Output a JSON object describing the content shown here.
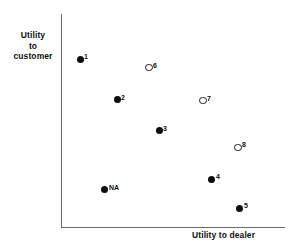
{
  "chart_data": {
    "type": "scatter",
    "title": "",
    "xlabel": "Utility to dealer",
    "ylabel": "Utility\nto\ncustomer",
    "grid": false,
    "legend": null,
    "axis_style": "open-corner-axes-no-ticks",
    "xlim": [
      0,
      100
    ],
    "ylim": [
      0,
      100
    ],
    "note": "Axes are unlabeled qualitative scales; values below are read off relative pixel positions.",
    "marker_styles": {
      "filled": "solid black circle",
      "open": "hollow black-outlined circle"
    },
    "points": [
      {
        "label": "1",
        "x": 8.5,
        "y": 78.7,
        "marker": "filled",
        "label_pos": "right"
      },
      {
        "label": "6",
        "x": 39.3,
        "y": 74.8,
        "marker": "open",
        "label_pos": "right"
      },
      {
        "label": "2",
        "x": 25.0,
        "y": 59.8,
        "marker": "filled",
        "label_pos": "right"
      },
      {
        "label": "7",
        "x": 63.4,
        "y": 59.3,
        "marker": "open",
        "label_pos": "right"
      },
      {
        "label": "3",
        "x": 43.8,
        "y": 45.3,
        "marker": "filled",
        "label_pos": "right"
      },
      {
        "label": "8",
        "x": 79.0,
        "y": 37.4,
        "marker": "open",
        "label_pos": "right"
      },
      {
        "label": "4",
        "x": 67.4,
        "y": 22.4,
        "marker": "filled",
        "label_pos": "right"
      },
      {
        "label": "NA",
        "x": 19.6,
        "y": 17.8,
        "marker": "filled",
        "label_pos": "right"
      },
      {
        "label": "5",
        "x": 79.9,
        "y": 8.9,
        "marker": "filled",
        "label_pos": "right"
      }
    ]
  },
  "plot_geometry": {
    "origin_x_px": 61,
    "origin_y_px": 227,
    "plot_width_px": 224,
    "plot_height_px": 213
  },
  "colors": {
    "axis": "#6b6b6b",
    "marker_fill": "#0d0d0d",
    "marker_open_stroke": "#1a1a1a",
    "text": "#111111",
    "background": "#ffffff"
  }
}
